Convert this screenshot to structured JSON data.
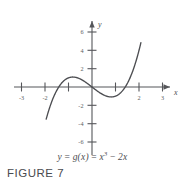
{
  "figure": {
    "caption": "FIGURE 7",
    "equation": {
      "lhs": "y",
      "eq1": "=",
      "fn": "g(x)",
      "eq2": "=",
      "term1_base": "x",
      "term1_exp": "3",
      "operator": "−",
      "term2": "2x",
      "plain": "y = g(x) = x³ − 2x"
    },
    "ink_color": "#4d4e52",
    "axis_color": "#55565a",
    "background_color": "#ffffff"
  },
  "chart_data": {
    "type": "line",
    "title": "",
    "subtitle": "",
    "xlabel": "x",
    "ylabel": "y",
    "function": "y = g(x) = x^3 - 2x",
    "xlim": [
      -3.6,
      3.6
    ],
    "ylim": [
      -7.2,
      7.2
    ],
    "grid": false,
    "legend": null,
    "x_ticks": [
      -3,
      -2,
      -1,
      1,
      2,
      3
    ],
    "x_tick_labels": [
      "-3",
      "-2",
      "",
      "",
      "2",
      "3"
    ],
    "y_ticks": [
      6,
      4,
      2,
      -2,
      -4,
      -6
    ],
    "y_tick_labels": [
      "6",
      "4",
      "2",
      "-2",
      "-4",
      "-6"
    ],
    "x_domain_drawn": [
      -1.95,
      2.08
    ],
    "series": [
      {
        "name": "g(x) = x^3 - 2x",
        "color": "#4d4e52",
        "x": [
          -1.95,
          -1.8,
          -1.6,
          -1.4142,
          -1.2,
          -1.0,
          -0.8165,
          -0.6,
          -0.4,
          -0.2,
          0.0,
          0.2,
          0.4,
          0.6,
          0.8165,
          1.0,
          1.2,
          1.4142,
          1.6,
          1.8,
          2.0,
          2.08
        ],
        "y": [
          -3.51,
          -2.23,
          -0.9,
          0.0,
          0.67,
          1.0,
          1.089,
          0.984,
          0.736,
          0.392,
          0.0,
          -0.392,
          -0.736,
          -0.984,
          -1.089,
          -1.0,
          -0.67,
          0.0,
          0.9,
          2.23,
          4.0,
          4.84
        ]
      }
    ],
    "roots": [
      -1.4142,
      0,
      1.4142
    ],
    "local_max": {
      "x": -0.8165,
      "y": 1.0887
    },
    "local_min": {
      "x": 0.8165,
      "y": -1.0887
    },
    "axis_arrows": [
      "x-positive",
      "y-positive"
    ]
  }
}
